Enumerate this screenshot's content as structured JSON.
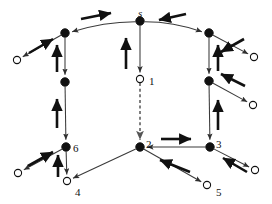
{
  "figure": {
    "name": "routing-tree-graph",
    "background_color": "#ffffff",
    "line_color": "#3a3a3a",
    "bold_arrow_color": "#111111",
    "node_fill_solid": "#111111",
    "node_fill_hollow": "#ffffff",
    "node_stroke": "#111111",
    "dashed_edge_color": "#555555"
  },
  "nodes": [
    {
      "id": "s",
      "label": "s",
      "type": "solid",
      "x": 140,
      "y": 21,
      "label_dx": -2,
      "label_dy": -13,
      "italic": true
    },
    {
      "id": "a",
      "label": "",
      "type": "solid",
      "x": 65,
      "y": 33,
      "label_dx": 0,
      "label_dy": 0,
      "italic": false
    },
    {
      "id": "b",
      "label": "",
      "type": "solid",
      "x": 209,
      "y": 33,
      "label_dx": 0,
      "label_dy": 0,
      "italic": false
    },
    {
      "id": "c",
      "label": "",
      "type": "solid",
      "x": 65,
      "y": 82,
      "label_dx": 0,
      "label_dy": 0,
      "italic": false
    },
    {
      "id": "d",
      "label": "",
      "type": "solid",
      "x": 209,
      "y": 81,
      "label_dx": 0,
      "label_dy": 0,
      "italic": false
    },
    {
      "id": "6",
      "label": "6",
      "type": "solid",
      "x": 66,
      "y": 147,
      "label_dx": 7,
      "label_dy": -4,
      "italic": false
    },
    {
      "id": "2",
      "label": "2",
      "type": "solid",
      "x": 140,
      "y": 147,
      "label_dx": 6,
      "label_dy": -8,
      "italic": false
    },
    {
      "id": "3",
      "label": "3",
      "type": "solid",
      "x": 210,
      "y": 147,
      "label_dx": 6,
      "label_dy": -8,
      "italic": false
    },
    {
      "id": "1",
      "label": "1",
      "type": "hollow",
      "x": 140,
      "y": 79,
      "label_dx": 9,
      "label_dy": -3,
      "italic": false
    },
    {
      "id": "4",
      "label": "4",
      "type": "hollow",
      "x": 67,
      "y": 181,
      "label_dx": 8,
      "label_dy": 6,
      "italic": false
    },
    {
      "id": "5",
      "label": "5",
      "type": "hollow",
      "x": 207,
      "y": 185,
      "label_dx": 9,
      "label_dy": 2,
      "italic": false
    },
    {
      "id": "t1",
      "label": "",
      "type": "hollow",
      "x": 17,
      "y": 60,
      "label_dx": 0,
      "label_dy": 0,
      "italic": false
    },
    {
      "id": "t2",
      "label": "",
      "type": "hollow",
      "x": 254,
      "y": 57,
      "label_dx": 0,
      "label_dy": 0,
      "italic": false
    },
    {
      "id": "t3",
      "label": "",
      "type": "hollow",
      "x": 253,
      "y": 105,
      "label_dx": 0,
      "label_dy": 0,
      "italic": false
    },
    {
      "id": "t4",
      "label": "",
      "type": "hollow",
      "x": 18,
      "y": 173,
      "label_dx": 0,
      "label_dy": 0,
      "italic": false
    },
    {
      "id": "t5",
      "label": "",
      "type": "hollow",
      "x": 255,
      "y": 170,
      "label_dx": 0,
      "label_dy": 0,
      "italic": false
    }
  ],
  "edges": [
    {
      "name": "edge-s-to-a",
      "from": "s",
      "to": "a",
      "style": "solid",
      "curve": true
    },
    {
      "name": "edge-s-to-b",
      "from": "s",
      "to": "b",
      "style": "solid",
      "curve": true
    },
    {
      "name": "edge-s-to-1",
      "from": "s",
      "to": "1",
      "style": "solid",
      "curve": false
    },
    {
      "name": "edge-a-to-t1",
      "from": "a",
      "to": "t1",
      "style": "solid",
      "curve": false
    },
    {
      "name": "edge-a-to-c",
      "from": "a",
      "to": "c",
      "style": "solid",
      "curve": false
    },
    {
      "name": "edge-c-to-6",
      "from": "c",
      "to": "6",
      "style": "solid",
      "curve": false
    },
    {
      "name": "edge-6-to-4",
      "from": "6",
      "to": "4",
      "style": "solid",
      "curve": false
    },
    {
      "name": "edge-6-to-t4",
      "from": "6",
      "to": "t4",
      "style": "solid",
      "curve": false
    },
    {
      "name": "edge-b-to-t2",
      "from": "b",
      "to": "t2",
      "style": "solid",
      "curve": false
    },
    {
      "name": "edge-b-to-d",
      "from": "b",
      "to": "d",
      "style": "solid",
      "curve": false
    },
    {
      "name": "edge-d-to-t3",
      "from": "d",
      "to": "t3",
      "style": "solid",
      "curve": false
    },
    {
      "name": "edge-d-to-3",
      "from": "d",
      "to": "3",
      "style": "solid",
      "curve": false
    },
    {
      "name": "edge-3-to-2",
      "from": "3",
      "to": "2",
      "style": "solid",
      "curve": false
    },
    {
      "name": "edge-3-to-t5",
      "from": "3",
      "to": "t5",
      "style": "solid",
      "curve": false
    },
    {
      "name": "edge-2-to-4",
      "from": "2",
      "to": "4",
      "style": "solid",
      "curve": false
    },
    {
      "name": "edge-2-to-5",
      "from": "2",
      "to": "5",
      "style": "solid",
      "curve": false
    },
    {
      "name": "edge-1-to-2",
      "from": "1",
      "to": "2",
      "style": "dashed",
      "curve": false
    }
  ],
  "flow_arrows": [
    {
      "name": "flow-arrow-top-left",
      "x1": 81,
      "y1": 19,
      "x2": 111,
      "y2": 13
    },
    {
      "name": "flow-arrow-top-right",
      "x1": 186,
      "y1": 14,
      "x2": 159,
      "y2": 20
    },
    {
      "name": "flow-arrow-s-down-column",
      "x1": 126,
      "y1": 69,
      "x2": 126,
      "y2": 38
    },
    {
      "name": "flow-arrow-upper-left-out",
      "x1": 29,
      "y1": 53,
      "x2": 53,
      "y2": 39
    },
    {
      "name": "flow-arrow-a-c-column",
      "x1": 57,
      "y1": 72,
      "x2": 57,
      "y2": 45
    },
    {
      "name": "flow-arrow-c-6-column",
      "x1": 57,
      "y1": 128,
      "x2": 57,
      "y2": 99
    },
    {
      "name": "flow-arrow-6-out",
      "x1": 28,
      "y1": 166,
      "x2": 53,
      "y2": 152
    },
    {
      "name": "flow-arrow-6-4-column",
      "x1": 58,
      "y1": 177,
      "x2": 58,
      "y2": 155
    },
    {
      "name": "flow-arrow-upper-right-out",
      "x1": 244,
      "y1": 39,
      "x2": 221,
      "y2": 52
    },
    {
      "name": "flow-arrow-b-d-column",
      "x1": 218,
      "y1": 71,
      "x2": 218,
      "y2": 45
    },
    {
      "name": "flow-arrow-d-out",
      "x1": 245,
      "y1": 86,
      "x2": 221,
      "y2": 74
    },
    {
      "name": "flow-arrow-d-3-column",
      "x1": 218,
      "y1": 130,
      "x2": 218,
      "y2": 100
    },
    {
      "name": "flow-arrow-3-to-2",
      "x1": 161,
      "y1": 139,
      "x2": 191,
      "y2": 139
    },
    {
      "name": "flow-arrow-2-5",
      "x1": 190,
      "y1": 172,
      "x2": 160,
      "y2": 160
    },
    {
      "name": "flow-arrow-3-t5",
      "x1": 247,
      "y1": 172,
      "x2": 223,
      "y2": 158
    }
  ]
}
